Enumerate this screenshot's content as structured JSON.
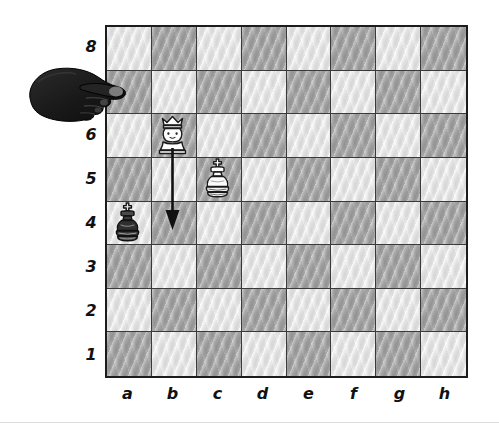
{
  "board": {
    "files": [
      "a",
      "b",
      "c",
      "d",
      "e",
      "f",
      "g",
      "h"
    ],
    "ranks": [
      "8",
      "7",
      "6",
      "5",
      "4",
      "3",
      "2",
      "1"
    ],
    "light_square_color": "#e7e7e7",
    "dark_square_color": "#a9a9a9",
    "border_color": "#1c1c1c",
    "grid_line_color": "#3a3a3a",
    "a8_square_color": "light",
    "a1_square_color": "dark",
    "background_color": "#ffffff"
  },
  "pieces": [
    {
      "id": "white-queen-b6",
      "type": "queen",
      "color": "white",
      "square": "b6",
      "file": "b",
      "rank": "6"
    },
    {
      "id": "white-king-c5",
      "type": "king",
      "color": "white",
      "square": "c5",
      "file": "c",
      "rank": "5"
    },
    {
      "id": "black-king-a4",
      "type": "king",
      "color": "black",
      "square": "a4",
      "file": "a",
      "rank": "4"
    }
  ],
  "move_arrow": {
    "from_square": "b6",
    "to_square": "b4",
    "direction": "down",
    "color": "#111111"
  },
  "cursor": {
    "type": "hand-pointer",
    "color": "#1a1a1a",
    "pointing": "right",
    "near_square": "a7"
  }
}
